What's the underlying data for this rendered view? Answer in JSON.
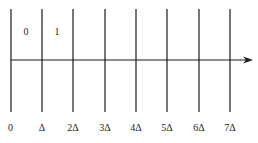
{
  "diagram": {
    "type": "timeline-grid",
    "colors": {
      "line": "#1a1a1a",
      "text": "#222222",
      "background": "#ffffff"
    },
    "ticks": [
      {
        "x": 11,
        "label": "0"
      },
      {
        "x": 42,
        "label": "Δ"
      },
      {
        "x": 73,
        "label": "2Δ"
      },
      {
        "x": 105,
        "label": "3Δ"
      },
      {
        "x": 136,
        "label": "4Δ"
      },
      {
        "x": 167,
        "label": "5Δ"
      },
      {
        "x": 199,
        "label": "6Δ"
      },
      {
        "x": 230,
        "label": "7Δ"
      }
    ],
    "cell_labels": [
      {
        "x": 26,
        "label": "0"
      },
      {
        "x": 57,
        "label": "1"
      }
    ],
    "axis": {
      "y": 60,
      "x_start": 11,
      "x_end": 253,
      "arrow": "right"
    },
    "line_top": 9,
    "line_bottom": 112,
    "tick_label_y": 131,
    "cell_label_y": 35
  }
}
